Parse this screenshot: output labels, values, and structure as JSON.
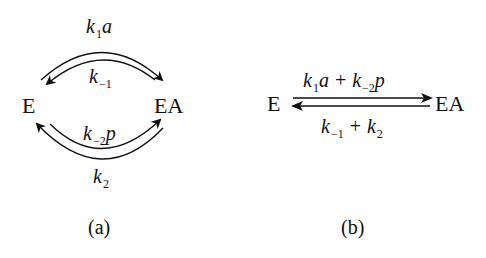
{
  "panel_a": {
    "caption": "(a)",
    "nodes": {
      "left": "E",
      "right": "EA"
    },
    "rates": {
      "top_outer": {
        "k": "k",
        "sub": "1",
        "suffix": "a"
      },
      "top_inner": {
        "k": "k",
        "sub": "−1",
        "suffix": ""
      },
      "bottom_inner": {
        "k": "k",
        "sub": "−2",
        "suffix": "p"
      },
      "bottom_outer": {
        "k": "k",
        "sub": "2",
        "suffix": ""
      }
    },
    "arrows": [
      {
        "name": "top-outer-arc",
        "from": "E",
        "to": "EA",
        "rate": "k1a"
      },
      {
        "name": "top-inner-arc",
        "from": "EA",
        "to": "E",
        "rate": "k-1"
      },
      {
        "name": "bottom-inner-arc",
        "from": "EA",
        "to": "E",
        "rate": "k-2p"
      },
      {
        "name": "bottom-outer-arc",
        "from": "E",
        "to": "EA",
        "rate": "k2"
      }
    ]
  },
  "panel_b": {
    "caption": "(b)",
    "nodes": {
      "left": "E",
      "right": "EA"
    },
    "forward": {
      "t1": {
        "k": "k",
        "sub": "1",
        "suffix": "a"
      },
      "op": "+",
      "t2": {
        "k": "k",
        "sub": "−2",
        "suffix": "p"
      }
    },
    "reverse": {
      "t1": {
        "k": "k",
        "sub": "−1",
        "suffix": ""
      },
      "op": "+",
      "t2": {
        "k": "k",
        "sub": "2",
        "suffix": ""
      }
    }
  },
  "colors": {
    "ink": "#111111",
    "background": "#ffffff"
  }
}
